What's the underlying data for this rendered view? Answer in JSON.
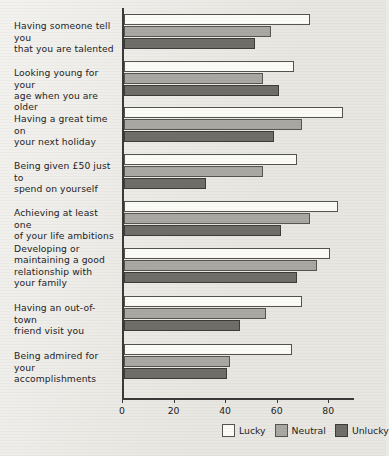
{
  "chart_data": {
    "type": "bar",
    "title": "",
    "xlabel": "",
    "ylabel": "",
    "orientation": "horizontal",
    "grid": false,
    "legend_position": "bottom-right",
    "xlim": [
      0,
      90
    ],
    "xticks": [
      0,
      20,
      40,
      60,
      80
    ],
    "xtick_labels": [
      "0",
      "20",
      "40",
      "60",
      "80"
    ],
    "categories": [
      "Having someone tell you that you are talented",
      "Looking young for your age when you are older",
      "Having a great time on your next holiday",
      "Being given £50 just to spend on yourself",
      "Achieving at least one of your life ambitions",
      "Developing or maintaining a good relationship with your family",
      "Having an out-of-town friend visit you",
      "Being admired for your accomplishments"
    ],
    "category_lines": [
      [
        "Having someone tell you",
        "that you are talented"
      ],
      [
        "Looking young for your",
        "age when you are older"
      ],
      [
        "Having a great time on",
        "your next holiday"
      ],
      [
        "Being given £50 just to",
        "spend on yourself"
      ],
      [
        "Achieving at least one",
        "of your life ambitions"
      ],
      [
        "Developing or",
        "maintaining a good",
        "relationship with",
        "your family"
      ],
      [
        "Having an out-of-town",
        "friend visit you"
      ],
      [
        "Being admired for your",
        "accomplishments"
      ]
    ],
    "series": [
      {
        "name": "Lucky",
        "color": "#fbfbf8",
        "values": [
          72,
          66,
          85,
          67,
          83,
          80,
          69,
          65
        ]
      },
      {
        "name": "Neutral",
        "color": "#a9a8a2",
        "values": [
          57,
          54,
          69,
          54,
          72,
          75,
          55,
          41
        ]
      },
      {
        "name": "Unlucky",
        "color": "#6f6e69",
        "values": [
          51,
          60,
          58,
          32,
          61,
          67,
          45,
          40
        ]
      }
    ]
  },
  "legend": {
    "items": [
      {
        "label": "Lucky",
        "swatch": "lucky-swatch"
      },
      {
        "label": "Neutral",
        "swatch": "neutral-swatch"
      },
      {
        "label": "Unlucky",
        "swatch": "unlucky-swatch"
      }
    ]
  }
}
